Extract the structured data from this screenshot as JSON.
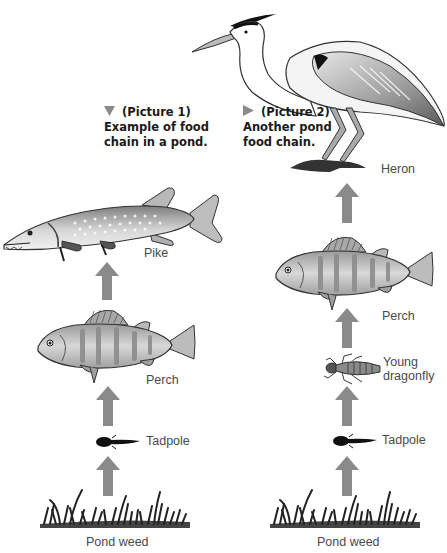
{
  "diagram": {
    "type": "food-chain",
    "colors": {
      "arrow": "#8a8a8a",
      "marker": "#8a8a8a",
      "caption_text": "#1a1a1a",
      "label_text": "#4a4a4a"
    },
    "picture1": {
      "title": "(Picture 1)",
      "caption_line1": "Example of food",
      "caption_line2": "chain in a pond.",
      "marker_icon": "down-triangle-icon",
      "organisms": [
        {
          "name": "Pike",
          "icon": "pike-fish-icon"
        },
        {
          "name": "Perch",
          "icon": "perch-fish-icon"
        },
        {
          "name": "Tadpole",
          "icon": "tadpole-icon"
        },
        {
          "name": "Pond weed",
          "icon": "pond-weed-icon"
        }
      ]
    },
    "picture2": {
      "title": "(Picture 2)",
      "caption_line1": "Another pond",
      "caption_line2": "food chain.",
      "marker_icon": "right-triangle-icon",
      "organisms": [
        {
          "name": "Heron",
          "icon": "heron-icon"
        },
        {
          "name": "Perch",
          "icon": "perch-fish-icon"
        },
        {
          "name": "Young",
          "name_line2": "dragonfly",
          "icon": "dragonfly-larva-icon"
        },
        {
          "name": "Tadpole",
          "icon": "tadpole-icon"
        },
        {
          "name": "Pond weed",
          "icon": "pond-weed-icon"
        }
      ]
    }
  }
}
